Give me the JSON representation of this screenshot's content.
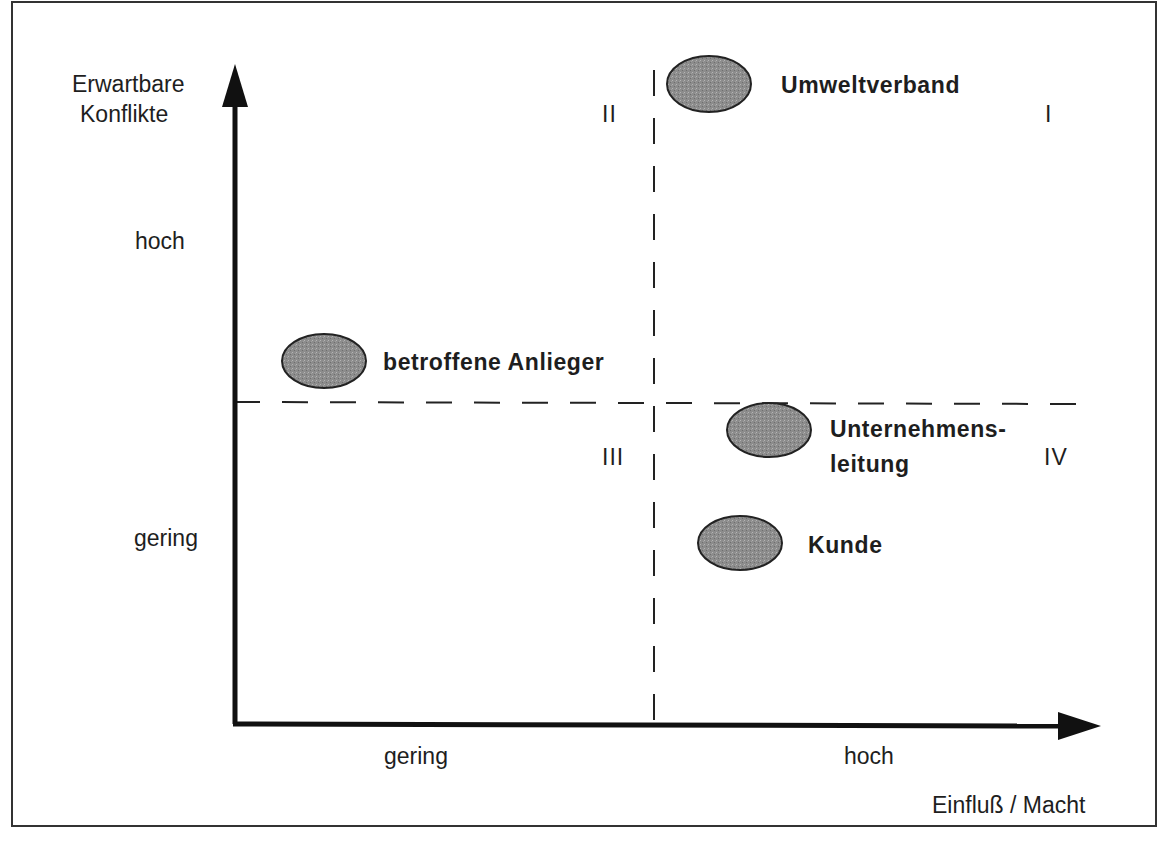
{
  "diagram": {
    "type": "stakeholder-portfolio-matrix",
    "y_axis": {
      "title_line1": "Erwartbare",
      "title_line2": "Konflikte",
      "tick_high": "hoch",
      "tick_low": "gering"
    },
    "x_axis": {
      "title": "Einfluß / Macht",
      "tick_low": "gering",
      "tick_high": "hoch"
    },
    "quadrants": {
      "q1": "I",
      "q2": "II",
      "q3": "III",
      "q4": "IV"
    },
    "stakeholders": [
      {
        "label": "Umweltverband",
        "quadrant": "I"
      },
      {
        "label": "betroffene Anlieger",
        "quadrant": "II"
      },
      {
        "label_line1": "Unternehmens-",
        "label_line2": "leitung",
        "quadrant": "IV"
      },
      {
        "label": "Kunde",
        "quadrant": "IV"
      }
    ],
    "colors": {
      "axis": "#111111",
      "ellipse_fill": "#8a8a8a",
      "ellipse_stroke": "#222222",
      "divider": "#222222"
    }
  }
}
